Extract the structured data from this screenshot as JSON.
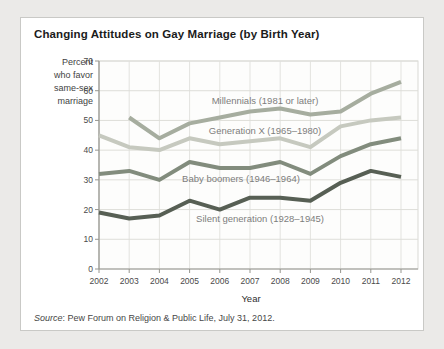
{
  "figure": {
    "title": "Changing Attitudes on Gay Marriage (by Birth Year)",
    "source_prefix": "Source",
    "source_rest": ": Pew Forum on Religion & Public Life, July 31, 2012."
  },
  "chart_data": {
    "type": "line",
    "title": "Changing Attitudes on Gay Marriage (by Birth Year)",
    "xlabel": "Year",
    "ylabel_lines": [
      "Percent",
      "who favor",
      "same-sex",
      "marriage"
    ],
    "x": [
      2002,
      2003,
      2004,
      2005,
      2006,
      2007,
      2008,
      2009,
      2010,
      2011,
      2012
    ],
    "ylim": [
      0,
      70
    ],
    "yticks": [
      0,
      10,
      20,
      30,
      40,
      50,
      60,
      70
    ],
    "grid": true,
    "legend_position": "inline-labels",
    "series": [
      {
        "key": "millennials",
        "name": "Millennials (1981 or later)",
        "color": "#a6ad9f",
        "x": [
          2003,
          2004,
          2005,
          2006,
          2007,
          2008,
          2009,
          2010,
          2011,
          2012
        ],
        "values": [
          51,
          44,
          49,
          51,
          53,
          54,
          52,
          53,
          59,
          63
        ]
      },
      {
        "key": "genx",
        "name": "Generation X (1965–1980)",
        "color": "#c6c9bf",
        "x": [
          2002,
          2003,
          2004,
          2005,
          2006,
          2007,
          2008,
          2009,
          2010,
          2011,
          2012
        ],
        "values": [
          45,
          41,
          40,
          44,
          42,
          43,
          44,
          41,
          48,
          50,
          51
        ]
      },
      {
        "key": "boomers",
        "name": "Baby boomers (1946–1964)",
        "color": "#828c7d",
        "x": [
          2002,
          2003,
          2004,
          2005,
          2006,
          2007,
          2008,
          2009,
          2010,
          2011,
          2012
        ],
        "values": [
          32,
          33,
          30,
          36,
          34,
          34,
          36,
          32,
          38,
          42,
          44
        ]
      },
      {
        "key": "silent",
        "name": "Silent generation (1928–1945)",
        "color": "#575f54",
        "x": [
          2002,
          2003,
          2004,
          2005,
          2006,
          2007,
          2008,
          2009,
          2010,
          2011,
          2012
        ],
        "values": [
          19,
          17,
          18,
          23,
          20,
          24,
          24,
          23,
          29,
          33,
          31
        ]
      }
    ],
    "source": "Source: Pew Forum on Religion & Public Life, July 31, 2012."
  }
}
